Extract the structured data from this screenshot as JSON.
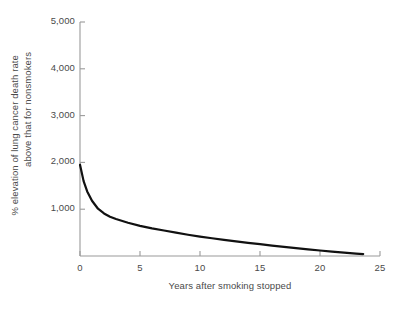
{
  "chart_data": {
    "type": "line",
    "title": "",
    "xlabel": "Years after smoking stopped",
    "ylabel_lines": [
      "% elevation of lung cancer death rate",
      "above that for nonsmokers"
    ],
    "xlim": [
      0,
      25
    ],
    "ylim": [
      0,
      5000
    ],
    "xticks": [
      0,
      5,
      10,
      15,
      20,
      25
    ],
    "xtick_labels": [
      "0",
      "5",
      "10",
      "15",
      "20",
      "25"
    ],
    "yticks": [
      0,
      1000,
      2000,
      3000,
      4000,
      5000
    ],
    "ytick_labels": [
      "",
      "1,000",
      "2,000",
      "3,000",
      "4,000",
      "5,000"
    ],
    "grid": false,
    "legend": false,
    "line_color": "#111111",
    "axis_color": "#9a9a9a",
    "background_color": "#ffffff",
    "series": [
      {
        "name": "Excess lung cancer death rate",
        "x": [
          0.0,
          0.3,
          0.6,
          1.0,
          1.5,
          2.0,
          2.5,
          3.0,
          4.0,
          5.0,
          6.0,
          7.0,
          8.0,
          9.0,
          10.0,
          11.0,
          12.0,
          13.0,
          14.0,
          15.0,
          16.0,
          17.0,
          18.0,
          19.0,
          20.0,
          21.0,
          22.0,
          23.0,
          23.6
        ],
        "y": [
          1950,
          1600,
          1380,
          1180,
          1010,
          910,
          840,
          790,
          710,
          645,
          590,
          545,
          500,
          455,
          415,
          380,
          345,
          312,
          282,
          252,
          222,
          195,
          168,
          142,
          118,
          95,
          72,
          52,
          42
        ]
      }
    ]
  },
  "axes_geometry": {
    "x0_px": 80,
    "x25_px": 380,
    "y0_px": 256,
    "y5000_px": 22
  }
}
